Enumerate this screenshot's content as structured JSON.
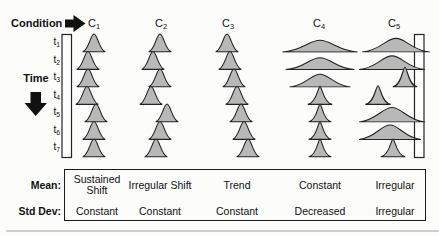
{
  "header": {
    "condition_label": "Condition"
  },
  "time_axis": {
    "label": "Time",
    "ticks": [
      {
        "base": "t",
        "sub": "1"
      },
      {
        "base": "t",
        "sub": "2"
      },
      {
        "base": "t",
        "sub": "3"
      },
      {
        "base": "t",
        "sub": "4"
      },
      {
        "base": "t",
        "sub": "5"
      },
      {
        "base": "t",
        "sub": "6"
      },
      {
        "base": "t",
        "sub": "7"
      }
    ]
  },
  "colors": {
    "bell_fill": "#b8b8b8",
    "outline": "#232323",
    "arrow": "#111111",
    "bracket_fill": "#ffffff"
  },
  "columns": [
    {
      "label": {
        "base": "C",
        "sub": "1"
      },
      "cx": 94,
      "bells": [
        {
          "cx": 94,
          "w": 24,
          "h": 21,
          "v": "bell"
        },
        {
          "cx": 88,
          "w": 24,
          "h": 21,
          "v": "bell"
        },
        {
          "cx": 88,
          "w": 24,
          "h": 21,
          "v": "bell"
        },
        {
          "cx": 87,
          "w": 24,
          "h": 21,
          "v": "bell"
        },
        {
          "cx": 96,
          "w": 24,
          "h": 21,
          "v": "bell"
        },
        {
          "cx": 94,
          "w": 24,
          "h": 21,
          "v": "bell"
        },
        {
          "cx": 94,
          "w": 24,
          "h": 21,
          "v": "bell"
        }
      ]
    },
    {
      "label": {
        "base": "C",
        "sub": "2"
      },
      "cx": 161,
      "bells": [
        {
          "cx": 160,
          "w": 24,
          "h": 21,
          "v": "bell"
        },
        {
          "cx": 153,
          "w": 24,
          "h": 21,
          "v": "bell"
        },
        {
          "cx": 160,
          "w": 24,
          "h": 21,
          "v": "bell"
        },
        {
          "cx": 151,
          "w": 24,
          "h": 21,
          "v": "bell"
        },
        {
          "cx": 167,
          "w": 24,
          "h": 21,
          "v": "bell"
        },
        {
          "cx": 160,
          "w": 24,
          "h": 21,
          "v": "bell"
        },
        {
          "cx": 156,
          "w": 24,
          "h": 21,
          "v": "bell"
        }
      ]
    },
    {
      "label": {
        "base": "C",
        "sub": "3"
      },
      "cx": 228,
      "bells": [
        {
          "cx": 227,
          "w": 24,
          "h": 21,
          "v": "bell"
        },
        {
          "cx": 230,
          "w": 24,
          "h": 21,
          "v": "bell"
        },
        {
          "cx": 234,
          "w": 24,
          "h": 21,
          "v": "bell"
        },
        {
          "cx": 237,
          "w": 24,
          "h": 21,
          "v": "bell"
        },
        {
          "cx": 241,
          "w": 24,
          "h": 21,
          "v": "bell"
        },
        {
          "cx": 244,
          "w": 24,
          "h": 21,
          "v": "bell"
        },
        {
          "cx": 248,
          "w": 24,
          "h": 21,
          "v": "bell"
        }
      ]
    },
    {
      "label": {
        "base": "C",
        "sub": "4"
      },
      "cx": 319,
      "bells": [
        {
          "cx": 320,
          "w": 80,
          "h": 14,
          "v": "bell"
        },
        {
          "cx": 320,
          "w": 73,
          "h": 14,
          "v": "bell"
        },
        {
          "cx": 320,
          "w": 65,
          "h": 15,
          "v": "bell"
        },
        {
          "cx": 320,
          "w": 26,
          "h": 20,
          "v": "peaked"
        },
        {
          "cx": 320,
          "w": 24,
          "h": 20,
          "v": "peaked"
        },
        {
          "cx": 320,
          "w": 24,
          "h": 20,
          "v": "peaked"
        },
        {
          "cx": 320,
          "w": 24,
          "h": 20,
          "v": "peaked"
        }
      ]
    },
    {
      "label": {
        "base": "C",
        "sub": "5"
      },
      "cx": 394,
      "bells": [
        {
          "cx": 396,
          "w": 72,
          "h": 16,
          "v": "bell"
        },
        {
          "cx": 392,
          "w": 70,
          "h": 16,
          "v": "bell"
        },
        {
          "cx": 405,
          "w": 26,
          "h": 22,
          "v": "peaked"
        },
        {
          "cx": 378,
          "w": 27,
          "h": 21,
          "v": "peaked"
        },
        {
          "cx": 392,
          "w": 70,
          "h": 17,
          "v": "bell"
        },
        {
          "cx": 390,
          "w": 66,
          "h": 17,
          "v": "bell"
        },
        {
          "cx": 393,
          "w": 26,
          "h": 20,
          "v": "peaked"
        }
      ]
    }
  ],
  "summary_table": {
    "row_labels": [
      "Mean:",
      "Std Dev:"
    ],
    "columns_x": [
      97,
      160,
      237,
      320,
      395
    ],
    "mean_values": [
      "Sustained Shift",
      "Irregular Shift",
      "Trend",
      "Constant",
      "Irregular"
    ],
    "std_values": [
      "Constant",
      "Constant",
      "Constant",
      "Decreased",
      "Irregular"
    ]
  }
}
